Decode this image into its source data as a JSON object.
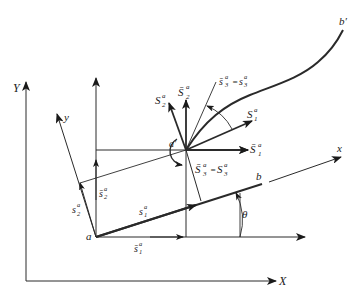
{
  "figure": {
    "colors": {
      "ink": "#1a1a1a",
      "background": "#ffffff"
    }
  },
  "labels": {
    "global_y_axis": "Y",
    "global_x_axis": "X",
    "local_y_axis": "y",
    "local_x_axis": "x",
    "point_a": "a",
    "point_a_prime": "a′",
    "point_b": "b",
    "point_b_prime": "b′",
    "theta": "θ",
    "S2_base": "S",
    "S2_sub": "2",
    "S2_sup": "a",
    "Sbar2_base": "S̄",
    "Sbar2_sub": "2",
    "Sbar2_sup": "a",
    "sbar3_eq_s3": "s̄₃ᵃ = s₃ᵃ",
    "sbar3_base": "s̄",
    "sbar3_sub": "3",
    "sbar3_sup": "a",
    "s3_base": "s",
    "s3_sub": "3",
    "s3_sup": "a",
    "equals": "=",
    "S1_base": "S",
    "S1_sub": "1",
    "S1_sup": "a",
    "Sbar1_base": "S̄",
    "Sbar1_sub": "1",
    "Sbar1_sup": "a",
    "Sbar3_base": "S̄",
    "Sbar3_sub": "3",
    "Sbar3_sup": "a",
    "S3_base": "S",
    "S3_sub": "3",
    "S3_sup": "a",
    "s2_base": "s",
    "s2_sub": "2",
    "s2_sup": "a",
    "sbar2_base": "s̄",
    "sbar2_sub": "2",
    "sbar2_sup": "a",
    "s1_base": "s",
    "s1_sub": "1",
    "s1_sup": "a",
    "sbar1_base": "s̄",
    "sbar1_sub": "1",
    "sbar1_sup": "a"
  }
}
